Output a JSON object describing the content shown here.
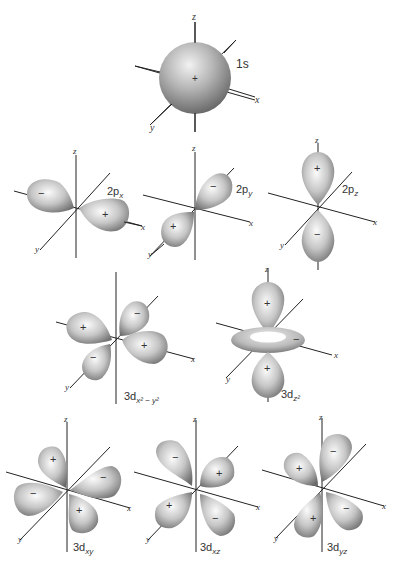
{
  "figure": {
    "axes": {
      "x": "x",
      "y": "y",
      "z": "z"
    },
    "colors": {
      "lobe_light": "#f4f4f4",
      "lobe_mid": "#bdbdbd",
      "lobe_dark": "#6e6e6e",
      "axis": "#222222",
      "text": "#333333"
    }
  },
  "orbitals": [
    {
      "id": "1s",
      "label": "1s",
      "sub": "",
      "signs": [
        "+"
      ]
    },
    {
      "id": "2px",
      "label": "2p",
      "sub": "x",
      "signs": [
        "−",
        "+"
      ]
    },
    {
      "id": "2py",
      "label": "2p",
      "sub": "y",
      "signs": [
        "−",
        "+"
      ]
    },
    {
      "id": "2pz",
      "label": "2p",
      "sub": "z",
      "signs": [
        "+",
        "−"
      ]
    },
    {
      "id": "3dx2y2",
      "label": "3d",
      "sub": "x² − y²",
      "signs": [
        "+",
        "−",
        "−",
        "+"
      ]
    },
    {
      "id": "3dz2",
      "label": "3d",
      "sub": "z²",
      "signs": [
        "+",
        "−",
        "+"
      ]
    },
    {
      "id": "3dxy",
      "label": "3d",
      "sub": "xy",
      "signs": [
        "+",
        "−",
        "−",
        "+"
      ]
    },
    {
      "id": "3dxz",
      "label": "3d",
      "sub": "xz",
      "signs": [
        "−",
        "+",
        "+",
        "−"
      ]
    },
    {
      "id": "3dyz",
      "label": "3d",
      "sub": "yz",
      "signs": [
        "−",
        "+",
        "+",
        "−"
      ]
    }
  ]
}
